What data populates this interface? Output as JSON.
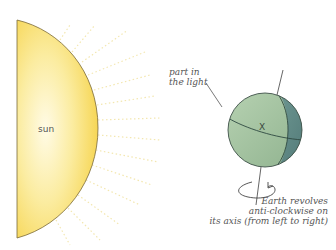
{
  "diagram": {
    "title": "",
    "sun": {
      "label": "sun",
      "fill_top": "#f7d54a",
      "fill_center": "#fdf7d8",
      "outline": "#7a6a3a"
    },
    "earth": {
      "label_light": "part in the light",
      "light_line1": "part in",
      "light_line2": "the light",
      "point_label": "X",
      "light_color": "#a3c3a0",
      "dark_color": "#5f8a86",
      "outline": "#3e5048"
    },
    "caption": {
      "line1": "Earth revolves",
      "line2": "anti-clockwise on",
      "line3": "its axis (from left to right)"
    },
    "rays_color": "#f3e7b0"
  }
}
